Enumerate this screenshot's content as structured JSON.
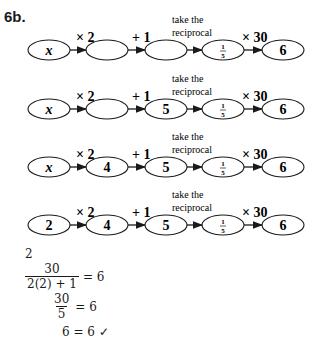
{
  "problem_label": "6b.",
  "operations": [
    "× 2",
    "+ 1",
    "take the reciprocal",
    "× 30"
  ],
  "op_reciprocal_line1": "take the",
  "op_reciprocal_line2": "reciprocal",
  "rows": [
    {
      "boxes": [
        "x",
        "",
        "",
        "1/5",
        "6"
      ]
    },
    {
      "boxes": [
        "x",
        "",
        "5",
        "1/5",
        "6"
      ]
    },
    {
      "boxes": [
        "x",
        "4",
        "5",
        "1/5",
        "6"
      ]
    },
    {
      "boxes": [
        "2",
        "4",
        "5",
        "1/5",
        "6"
      ]
    }
  ],
  "check": {
    "value": "2",
    "line1_num": "30",
    "line1_den": "2(2) + 1",
    "line1_rhs": "= 6",
    "line2_num": "30",
    "line2_den": "5",
    "line2_rhs": "= 6",
    "line3": "6 = 6",
    "checkmark": "✓"
  }
}
